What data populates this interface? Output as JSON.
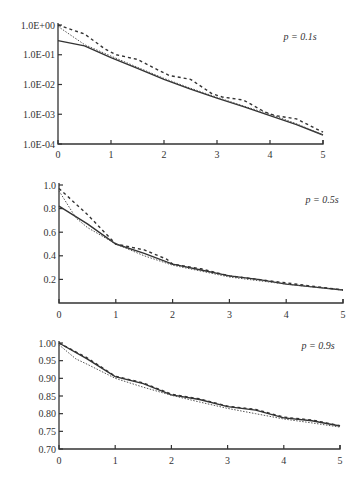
{
  "chart_data": [
    {
      "type": "line",
      "panel_label": "p = 0.1s",
      "title": "",
      "xlabel": "",
      "ylabel": "",
      "yscale": "log",
      "xlim": [
        0,
        5
      ],
      "ylim": [
        0.0001,
        1
      ],
      "x_ticks": [
        "0",
        "1",
        "2",
        "3",
        "4",
        "5"
      ],
      "y_ticks": [
        "1.0E+00",
        "1.0E-01",
        "1.0E-02",
        "1.0E-03",
        "1.0E-04"
      ],
      "grid": false,
      "series": [
        {
          "name": "solid",
          "style": "solid",
          "x": [
            0,
            0.5,
            1,
            1.5,
            2,
            2.5,
            3,
            3.5,
            4,
            4.5,
            5
          ],
          "y": [
            0.3,
            0.2,
            0.08,
            0.035,
            0.015,
            0.007,
            0.0035,
            0.0018,
            0.0009,
            0.00045,
            0.0002
          ]
        },
        {
          "name": "dotted",
          "style": "dotted",
          "x": [
            0,
            0.5,
            1,
            1.5,
            2,
            2.5,
            3,
            3.5,
            4,
            4.5,
            5
          ],
          "y": [
            0.9,
            0.22,
            0.09,
            0.038,
            0.016,
            0.0075,
            0.0037,
            0.0019,
            0.001,
            0.00048,
            0.0002
          ]
        },
        {
          "name": "dashed",
          "style": "dashed",
          "x": [
            0,
            0.5,
            0.9,
            1.1,
            1.5,
            1.9,
            2.1,
            2.5,
            2.9,
            3.1,
            3.5,
            3.9,
            4.1,
            4.5,
            5
          ],
          "y": [
            1.0,
            0.5,
            0.15,
            0.1,
            0.07,
            0.03,
            0.02,
            0.015,
            0.005,
            0.0038,
            0.003,
            0.0012,
            0.0009,
            0.0007,
            0.00025
          ]
        }
      ]
    },
    {
      "type": "line",
      "panel_label": "p = 0.5s",
      "title": "",
      "xlabel": "",
      "ylabel": "",
      "yscale": "linear",
      "xlim": [
        0,
        5
      ],
      "ylim": [
        0,
        1.0
      ],
      "x_ticks": [
        "0",
        "1",
        "2",
        "3",
        "4",
        "5"
      ],
      "y_ticks": [
        "1.0",
        "0.8",
        "0.6",
        "0.4",
        "0.2"
      ],
      "grid": false,
      "series": [
        {
          "name": "solid",
          "style": "solid",
          "x": [
            0,
            0.5,
            1,
            1.5,
            2,
            2.5,
            3,
            3.5,
            4,
            4.5,
            5
          ],
          "y": [
            0.82,
            0.67,
            0.5,
            0.42,
            0.33,
            0.28,
            0.23,
            0.2,
            0.16,
            0.135,
            0.11
          ]
        },
        {
          "name": "dotted",
          "style": "dotted",
          "x": [
            0,
            0.3,
            0.5,
            1,
            1.5,
            2,
            2.5,
            3,
            3.5,
            4,
            4.5,
            5
          ],
          "y": [
            0.95,
            0.72,
            0.64,
            0.5,
            0.4,
            0.32,
            0.27,
            0.22,
            0.19,
            0.16,
            0.135,
            0.11
          ]
        },
        {
          "name": "dashed",
          "style": "dashed",
          "x": [
            0,
            0.5,
            0.9,
            1,
            1.5,
            1.9,
            2,
            2.5,
            3,
            3.5,
            4,
            4.5,
            5
          ],
          "y": [
            0.97,
            0.75,
            0.55,
            0.5,
            0.45,
            0.37,
            0.33,
            0.29,
            0.23,
            0.2,
            0.17,
            0.14,
            0.11
          ]
        }
      ]
    },
    {
      "type": "line",
      "panel_label": "p = 0.9s",
      "title": "",
      "xlabel": "",
      "ylabel": "",
      "yscale": "linear",
      "xlim": [
        0,
        5
      ],
      "ylim": [
        0.7,
        1.0
      ],
      "x_ticks": [
        "0",
        "1",
        "2",
        "3",
        "4",
        "5"
      ],
      "y_ticks": [
        "1.00",
        "0.95",
        "0.90",
        "0.85",
        "0.80",
        "0.75",
        "0.70"
      ],
      "grid": false,
      "series": [
        {
          "name": "solid",
          "style": "solid",
          "x": [
            0,
            0.5,
            1,
            1.5,
            2,
            2.5,
            3,
            3.5,
            4,
            4.5,
            5
          ],
          "y": [
            1.0,
            0.955,
            0.905,
            0.885,
            0.853,
            0.84,
            0.82,
            0.81,
            0.788,
            0.78,
            0.765
          ]
        },
        {
          "name": "dotted",
          "style": "dotted",
          "x": [
            0,
            0.3,
            0.5,
            1,
            1.5,
            2,
            2.5,
            3,
            3.5,
            4,
            4.5,
            5
          ],
          "y": [
            0.995,
            0.955,
            0.94,
            0.9,
            0.875,
            0.852,
            0.833,
            0.815,
            0.8,
            0.785,
            0.774,
            0.762
          ]
        },
        {
          "name": "dashed",
          "style": "dashed",
          "x": [
            0,
            0.5,
            1,
            1.5,
            2,
            2.5,
            3,
            3.5,
            4,
            4.5,
            5
          ],
          "y": [
            1.0,
            0.958,
            0.906,
            0.887,
            0.855,
            0.842,
            0.821,
            0.812,
            0.79,
            0.782,
            0.766
          ]
        }
      ]
    }
  ]
}
